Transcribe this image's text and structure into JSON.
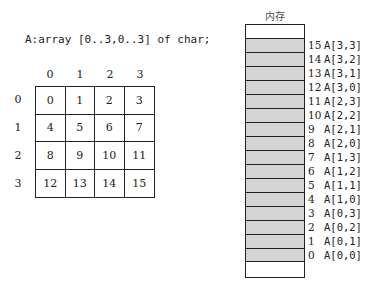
{
  "declaration": "A:array [0..3,0..3] of char;",
  "matrix": {
    "column_headers": [
      "0",
      "1",
      "2",
      "3"
    ],
    "row_headers": [
      "0",
      "1",
      "2",
      "3"
    ],
    "cells": [
      [
        "0",
        "1",
        "2",
        "3"
      ],
      [
        "4",
        "5",
        "6",
        "7"
      ],
      [
        "8",
        "9",
        "10",
        "11"
      ],
      [
        "12",
        "13",
        "14",
        "15"
      ]
    ]
  },
  "memory": {
    "title": "内存",
    "cell_fill": "#d4d4d4",
    "slots": [
      {
        "index": "15",
        "name": "A[3,3]"
      },
      {
        "index": "14",
        "name": "A[3,2]"
      },
      {
        "index": "13",
        "name": "A[3,1]"
      },
      {
        "index": "12",
        "name": "A[3,0]"
      },
      {
        "index": "11",
        "name": "A[2,3]"
      },
      {
        "index": "10",
        "name": "A[2,2]"
      },
      {
        "index": "9",
        "name": "A[2,1]"
      },
      {
        "index": "8",
        "name": "A[2,0]"
      },
      {
        "index": "7",
        "name": "A[1,3]"
      },
      {
        "index": "6",
        "name": "A[1,2]"
      },
      {
        "index": "5",
        "name": "A[1,1]"
      },
      {
        "index": "4",
        "name": "A[1,0]"
      },
      {
        "index": "3",
        "name": "A[0,3]"
      },
      {
        "index": "2",
        "name": "A[0,2]"
      },
      {
        "index": "1",
        "name": "A[0,1]"
      },
      {
        "index": "0",
        "name": "A[0,0]"
      }
    ]
  }
}
